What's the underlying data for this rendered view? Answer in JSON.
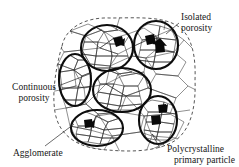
{
  "figure": {
    "background_color": "#ffffff",
    "ink_color": "#111111"
  },
  "labels": {
    "isolated_porosity": {
      "line1": "Isolated",
      "line2": "porosity"
    },
    "continuous_porosity": {
      "line1": "Continuous",
      "line2": "porosity"
    },
    "agglomerate": {
      "line1": "Agglomerate"
    },
    "polycrystalline_primary_particle": {
      "line1": "Polycrystalline",
      "line2": "primary particle"
    }
  },
  "diagram": {
    "agglomerate_boundary": {
      "style": "dashed",
      "shape": "rounded-blob"
    },
    "primary_particles": [
      {
        "id": "top-left",
        "cx": 107,
        "cy": 48,
        "rx": 26,
        "ry": 23
      },
      {
        "id": "top-right",
        "cx": 156,
        "cy": 45,
        "rx": 22,
        "ry": 24
      },
      {
        "id": "left",
        "cx": 75,
        "cy": 80,
        "rx": 16,
        "ry": 26
      },
      {
        "id": "center",
        "cx": 122,
        "cy": 90,
        "rx": 29,
        "ry": 22
      },
      {
        "id": "bottom-left",
        "cx": 97,
        "cy": 128,
        "rx": 26,
        "ry": 18
      },
      {
        "id": "bottom-right",
        "cx": 158,
        "cy": 120,
        "rx": 19,
        "ry": 24
      }
    ],
    "isolated_pores": [
      {
        "x": 118,
        "y": 42
      },
      {
        "x": 150,
        "y": 41
      },
      {
        "x": 159,
        "y": 48
      },
      {
        "x": 88,
        "y": 124
      },
      {
        "x": 162,
        "y": 110
      },
      {
        "x": 156,
        "y": 120
      }
    ]
  }
}
